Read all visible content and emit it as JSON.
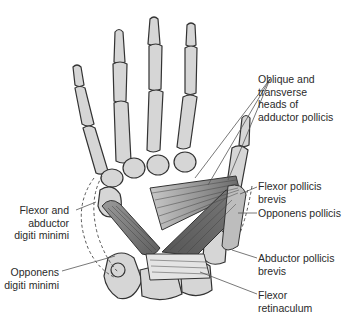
{
  "diagram": {
    "colors": {
      "bone_fill": "#d6d6d6",
      "bone_stroke": "#333333",
      "muscle_dark": "#6e6e6e",
      "muscle_mid": "#8a8a8a",
      "leader_line": "#555555",
      "text": "#2a2a2a",
      "background": "#ffffff"
    },
    "labels": {
      "adductor": "Oblique and\ntransverse\nheads of\nadductor pollicis",
      "fpb": "Flexor pollicis\nbrevis",
      "opponens_pollicis": "Opponens pollicis",
      "apb": "Abductor pollicis\nbrevis",
      "retinaculum": "Flexor\nretinaculum",
      "flexor_abductor_dm": "Flexor and\nabductor\ndigiti minimi",
      "opponens_dm": "Opponens\ndigiti minimi"
    }
  }
}
